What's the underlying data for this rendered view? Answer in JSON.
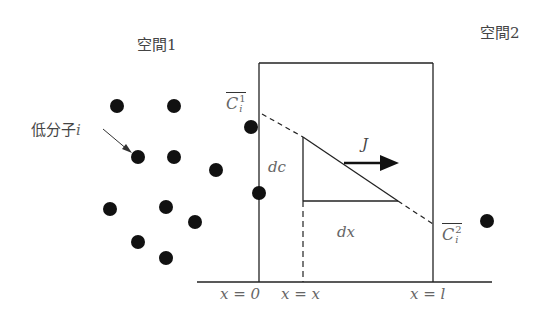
{
  "diagram": {
    "title_left": "空間1",
    "title_right": "空間2",
    "molecule_label": "低分子",
    "molecule_var": "i",
    "c1": {
      "base": "C",
      "sup": "1",
      "sub": "i"
    },
    "c2": {
      "base": "C",
      "sup": "2",
      "sub": "i"
    },
    "dc_label": "dc",
    "dx_label": "dx",
    "flux_label": "J",
    "axis_labels": [
      "x = 0",
      "x = x",
      "x = l"
    ],
    "colors": {
      "line": "#222222",
      "dot": "#111111",
      "text": "#555555"
    },
    "molecules": [
      {
        "x": 117,
        "y": 106
      },
      {
        "x": 174,
        "y": 106
      },
      {
        "x": 138,
        "y": 157
      },
      {
        "x": 174,
        "y": 157
      },
      {
        "x": 216,
        "y": 170
      },
      {
        "x": 251,
        "y": 127
      },
      {
        "x": 259,
        "y": 193
      },
      {
        "x": 110,
        "y": 209
      },
      {
        "x": 166,
        "y": 207
      },
      {
        "x": 195,
        "y": 222
      },
      {
        "x": 138,
        "y": 242
      },
      {
        "x": 166,
        "y": 258
      },
      {
        "x": 487,
        "y": 221
      }
    ]
  }
}
